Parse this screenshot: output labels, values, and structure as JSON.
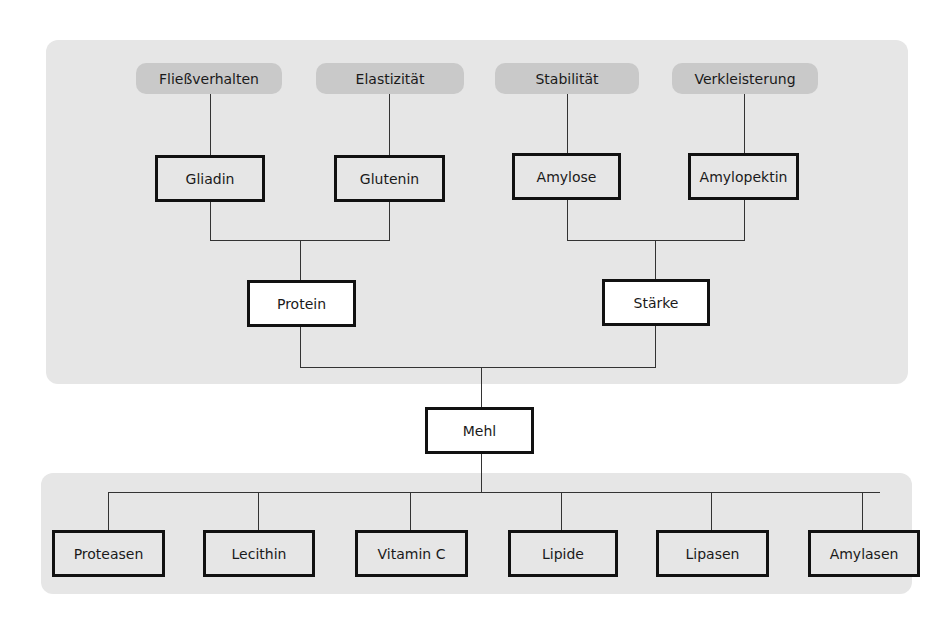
{
  "diagram": {
    "properties": [
      {
        "label": "Fließverhalten"
      },
      {
        "label": "Elastizität"
      },
      {
        "label": "Stabilität"
      },
      {
        "label": "Verkleisterung"
      }
    ],
    "components": [
      {
        "label": "Gliadin"
      },
      {
        "label": "Glutenin"
      },
      {
        "label": "Amylose"
      },
      {
        "label": "Amylopektin"
      }
    ],
    "groups": [
      {
        "label": "Protein"
      },
      {
        "label": "Stärke"
      }
    ],
    "root": {
      "label": "Mehl"
    },
    "additives": [
      {
        "label": "Proteasen"
      },
      {
        "label": "Lecithin"
      },
      {
        "label": "Vitamin C"
      },
      {
        "label": "Lipide"
      },
      {
        "label": "Lipasen"
      },
      {
        "label": "Amylasen"
      }
    ]
  }
}
